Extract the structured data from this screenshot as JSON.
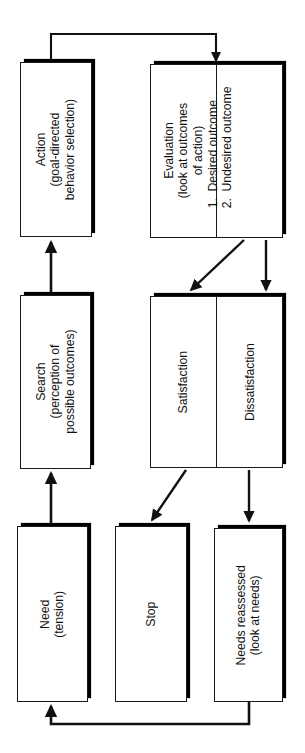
{
  "diagram": {
    "orientation": "rotated-90-ccw",
    "stroke_color": "#1a1a1a",
    "fill_color": "#ffffff",
    "shadow_color": "#000000",
    "nodes": [
      {
        "id": "action",
        "label": "Action\n(goal-directed\nbehavior selection)"
      },
      {
        "id": "evaluation",
        "label": "Evaluation\n(look at outcomes\nof action)"
      },
      {
        "id": "outcomes",
        "label": "1.  Desired outcome\n2.  Undesired outcome"
      },
      {
        "id": "search",
        "label": "Search\n(perception of\npossible outcomes)"
      },
      {
        "id": "satisfaction",
        "label": "Satisfaction"
      },
      {
        "id": "dissatisfaction",
        "label": "Dissatisfaction"
      },
      {
        "id": "need",
        "label": "Need\n(tension)"
      },
      {
        "id": "stop",
        "label": "Stop"
      },
      {
        "id": "needs-reassessed",
        "label": "Needs reassessed\n(look at needs)"
      }
    ],
    "edges": [
      {
        "id": "need-to-search",
        "from": "need",
        "to": "search",
        "style": "straight-arrow"
      },
      {
        "id": "search-to-action",
        "from": "search",
        "to": "action",
        "style": "straight-arrow"
      },
      {
        "id": "action-to-evaluation",
        "from": "action",
        "to": "evaluation",
        "style": "elbow-arrow"
      },
      {
        "id": "desired-to-satisfaction",
        "from": "outcomes",
        "to": "satisfaction",
        "style": "diagonal-arrow"
      },
      {
        "id": "undesired-to-dissatisfaction",
        "from": "outcomes",
        "to": "dissatisfaction",
        "style": "straight-arrow"
      },
      {
        "id": "satisfaction-to-stop",
        "from": "satisfaction",
        "to": "stop",
        "style": "diagonal-arrow"
      },
      {
        "id": "dissatisfaction-to-needs-reassessed",
        "from": "dissatisfaction",
        "to": "needs-reassessed",
        "style": "straight-arrow"
      },
      {
        "id": "needs-reassessed-to-need",
        "from": "needs-reassessed",
        "to": "need",
        "style": "elbow-arrow"
      }
    ]
  }
}
